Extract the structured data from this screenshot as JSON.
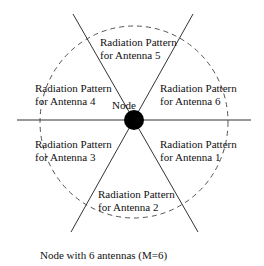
{
  "diagram": {
    "node_label": "Node",
    "caption": "Node with 6 antennas  (M=6)",
    "antennas": [
      {
        "line1": "Radiation Pattern",
        "line2": "for Antenna 1"
      },
      {
        "line1": "Radiation Pattern",
        "line2": "for Antenna 2"
      },
      {
        "line1": "Radiation Pattern",
        "line2": "for Antenna 3"
      },
      {
        "line1": "Radiation Pattern",
        "line2": "for Antenna 4"
      },
      {
        "line1": "Radiation Pattern",
        "line2": "for Antenna 5"
      },
      {
        "line1": "Radiation Pattern",
        "line2": "for Antenna 6"
      }
    ],
    "colors": {
      "line": "#333333",
      "node": "#000000",
      "dashed": "#555555"
    }
  }
}
